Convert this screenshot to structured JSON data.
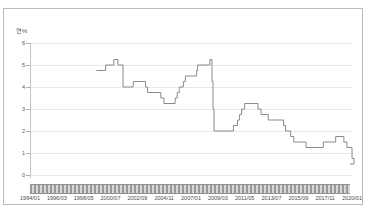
{
  "chart_data": {
    "type": "line",
    "title": "",
    "subtitle": "",
    "xlabel": "",
    "ylabel": "연%",
    "unit_label": "연%",
    "ylim": [
      0,
      6
    ],
    "yticks": [
      0,
      1,
      2,
      3,
      4,
      5,
      6
    ],
    "ytick_labels": [
      "0",
      "1",
      "2",
      "3",
      "4",
      "5",
      "6"
    ],
    "grid": true,
    "legend": null,
    "legend_position": "none",
    "line_color": "#8a8a8a",
    "xtick_labels": [
      "1994/01",
      "1996/03",
      "1998/05",
      "2000/07",
      "2002/09",
      "2004/11",
      "2007/01",
      "2009/03",
      "2011/05",
      "2013/07",
      "2015/09",
      "2017/11",
      "2020/01"
    ],
    "x_start": "1994/01",
    "x_end": "2020/01",
    "step_line": true,
    "series": [
      {
        "name": "기준금리",
        "x": [
          "1999/05",
          "2000/02",
          "2000/10",
          "2001/02",
          "2001/07",
          "2001/09",
          "2002/05",
          "2003/05",
          "2003/07",
          "2004/08",
          "2004/11",
          "2005/10",
          "2005/12",
          "2006/02",
          "2006/06",
          "2006/08",
          "2007/07",
          "2007/08",
          "2008/08",
          "2008/10",
          "2008/11",
          "2008/12",
          "2009/01",
          "2009/02",
          "2010/07",
          "2010/11",
          "2011/01",
          "2011/03",
          "2011/06",
          "2012/07",
          "2012/10",
          "2013/05",
          "2014/08",
          "2014/10",
          "2015/03",
          "2015/06",
          "2016/06",
          "2017/11",
          "2018/11",
          "2019/07",
          "2019/10",
          "2020/03",
          "2020/05"
        ],
        "values": [
          4.75,
          5.0,
          5.25,
          5.0,
          4.0,
          4.0,
          4.25,
          4.0,
          3.75,
          3.5,
          3.25,
          3.5,
          3.75,
          4.0,
          4.25,
          4.5,
          4.75,
          5.0,
          5.25,
          4.25,
          3.0,
          2.0,
          2.0,
          2.0,
          2.25,
          2.5,
          2.75,
          3.0,
          3.25,
          3.0,
          2.75,
          2.5,
          2.25,
          2.0,
          1.75,
          1.5,
          1.25,
          1.5,
          1.75,
          1.5,
          1.25,
          0.75,
          0.5
        ]
      }
    ],
    "notable_points": {
      "peak_value": 5.25,
      "crisis_drop_to": 2.0,
      "final_value": 0.5
    }
  },
  "axis": {
    "unit": "연%"
  },
  "scrollbar": {
    "name": "horizontal-scrollbar"
  }
}
